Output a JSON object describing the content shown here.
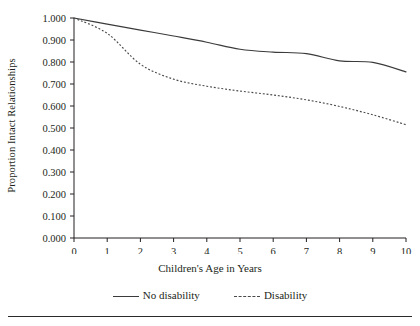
{
  "chart_data": {
    "type": "line",
    "title": "",
    "xlabel": "Children's Age in Years",
    "ylabel": "Proportion Intact Relationships",
    "x": [
      0,
      1,
      2,
      3,
      4,
      5,
      6,
      7,
      8,
      9,
      10
    ],
    "xlim": [
      0,
      10
    ],
    "ylim": [
      0.0,
      1.0
    ],
    "grid": false,
    "legend_position": "bottom",
    "xticks": [
      "0",
      "1",
      "2",
      "3",
      "4",
      "5",
      "6",
      "7",
      "8",
      "9",
      "10"
    ],
    "yticks": [
      "0.000",
      "0.100",
      "0.200",
      "0.300",
      "0.400",
      "0.500",
      "0.600",
      "0.700",
      "0.800",
      "0.900",
      "1.000"
    ],
    "series": [
      {
        "name": "No disability",
        "style": "solid",
        "color": "#3b3b3b",
        "values": [
          1.0,
          0.972,
          0.945,
          0.918,
          0.89,
          0.858,
          0.845,
          0.838,
          0.805,
          0.798,
          0.755
        ]
      },
      {
        "name": "Disability",
        "style": "dotted",
        "color": "#4a4a4a",
        "values": [
          1.0,
          0.93,
          0.79,
          0.722,
          0.69,
          0.668,
          0.65,
          0.628,
          0.598,
          0.56,
          0.515
        ]
      }
    ]
  },
  "legend": {
    "items": [
      {
        "label": "No disability"
      },
      {
        "label": "Disability"
      }
    ]
  }
}
